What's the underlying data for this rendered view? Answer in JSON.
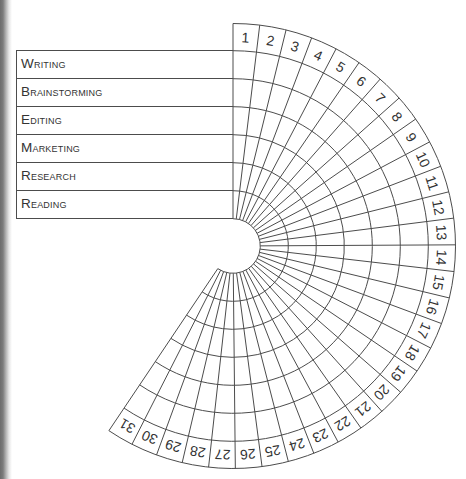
{
  "tracker": {
    "categories": [
      "Writing",
      "Brainstorming",
      "Editing",
      "Marketing",
      "Research",
      "Reading"
    ],
    "days": [
      "1",
      "2",
      "3",
      "4",
      "5",
      "6",
      "7",
      "8",
      "9",
      "10",
      "11",
      "12",
      "13",
      "14",
      "15",
      "16",
      "17",
      "18",
      "19",
      "20",
      "21",
      "22",
      "23",
      "24",
      "25",
      "26",
      "27",
      "28",
      "29",
      "30",
      "31"
    ]
  },
  "colors": {
    "grid_line": "#4c4c4c",
    "text": "#333333",
    "background": "#ffffff"
  }
}
